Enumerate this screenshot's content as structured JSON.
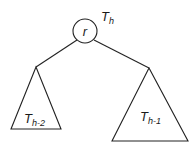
{
  "diagram": {
    "type": "tree",
    "tree_label": {
      "main": "T",
      "subscript": "h"
    },
    "root": {
      "label": "r"
    },
    "left_subtree": {
      "main": "T",
      "subscript": "h-2"
    },
    "right_subtree": {
      "main": "T",
      "subscript": "h-1"
    },
    "colors": {
      "stroke": "#222222",
      "background": "#ffffff"
    }
  }
}
